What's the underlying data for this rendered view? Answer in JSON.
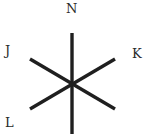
{
  "diagram": {
    "type": "six-ray star (three intersecting line segments)",
    "stroke_color": "#1f1f1f",
    "background": "#ffffff",
    "center": [
      72,
      84
    ],
    "segments": [
      {
        "name": "vertical",
        "from": [
          72,
          33
        ],
        "to": [
          72,
          134
        ]
      },
      {
        "name": "diag-down",
        "from": [
          30,
          59
        ],
        "to": [
          115,
          109
        ]
      },
      {
        "name": "diag-up",
        "from": [
          30,
          109
        ],
        "to": [
          115,
          59
        ]
      }
    ],
    "labels": [
      {
        "id": "N",
        "text": "N",
        "position": "top"
      },
      {
        "id": "J",
        "text": "J",
        "position": "upper-left"
      },
      {
        "id": "K",
        "text": "K",
        "position": "upper-right"
      },
      {
        "id": "L",
        "text": "L",
        "position": "lower-left"
      }
    ]
  }
}
